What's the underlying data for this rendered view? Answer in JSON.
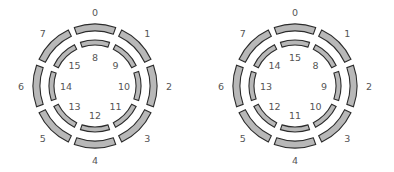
{
  "diagrams": [
    {
      "name": "left-ring-diagram",
      "outer_ring": {
        "segments": [
          "0",
          "1",
          "2",
          "3",
          "4",
          "5",
          "6",
          "7"
        ]
      },
      "inner_ring": {
        "segments": [
          "8",
          "9",
          "10",
          "11",
          "12",
          "13",
          "14",
          "15"
        ]
      }
    },
    {
      "name": "right-ring-diagram",
      "outer_ring": {
        "segments": [
          "0",
          "1",
          "2",
          "3",
          "4",
          "5",
          "6",
          "7"
        ]
      },
      "inner_ring": {
        "segments": [
          "15",
          "8",
          "9",
          "10",
          "11",
          "12",
          "13",
          "14"
        ]
      }
    }
  ],
  "colors": {
    "segment_fill": "#b8b8b8",
    "segment_stroke": "#2b2b2b",
    "label": "#555555"
  }
}
